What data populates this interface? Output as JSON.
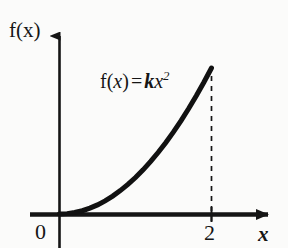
{
  "figure": {
    "axis_color": "#151515",
    "curve_color": "#111111",
    "background": "#fbfbfa"
  },
  "labels": {
    "y_axis": "f(x)",
    "x_axis": "x",
    "origin": "0",
    "tick_2": "2",
    "equation_plain": "f(x) = kx²",
    "equation_parts": {
      "f": "f(",
      "var1": "x",
      "close": ")",
      "equals": "=",
      "coef": "k",
      "var2": "x",
      "exponent": "2"
    }
  },
  "chart_data": {
    "type": "line",
    "title": "",
    "subtitle": "",
    "xlabel": "x",
    "ylabel": "f(x)",
    "function": "f(x) = kx^2",
    "coefficient_symbol": "k",
    "grid": false,
    "legend": null,
    "xlim": [
      0,
      2.35
    ],
    "ylim": [
      0,
      1.12
    ],
    "x_ticks": [
      0,
      2
    ],
    "x_tick_labels": [
      "0",
      "2"
    ],
    "y_ticks": [],
    "y_tick_labels": [],
    "annotations": [
      {
        "text": "f(x) = kx²",
        "x": 0.75,
        "y": 0.88,
        "type": "equation-label"
      },
      {
        "text": "dashed drop line at x = 2",
        "x": 2,
        "y": 1.0,
        "type": "guide"
      }
    ],
    "series": [
      {
        "name": "f(x) = kx^2",
        "style": "solid",
        "width": 4,
        "x": [
          0,
          0.1,
          0.2,
          0.3,
          0.4,
          0.5,
          0.6,
          0.7,
          0.8,
          0.9,
          1.0,
          1.1,
          1.2,
          1.3,
          1.4,
          1.5,
          1.6,
          1.7,
          1.8,
          1.9,
          2.0
        ],
        "values": [
          0,
          0.0025,
          0.01,
          0.0225,
          0.04,
          0.0625,
          0.09,
          0.1225,
          0.16,
          0.2025,
          0.25,
          0.3025,
          0.36,
          0.4225,
          0.49,
          0.5625,
          0.64,
          0.7225,
          0.81,
          0.9025,
          1.0
        ]
      },
      {
        "name": "drop line at x = 2",
        "style": "dashed",
        "width": 1.5,
        "x": [
          2,
          2
        ],
        "values": [
          0,
          1.0
        ]
      }
    ]
  }
}
